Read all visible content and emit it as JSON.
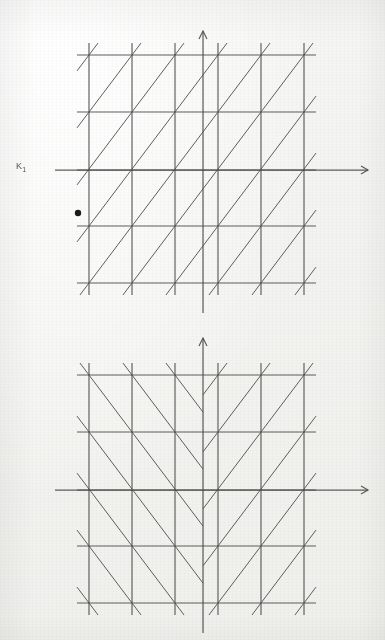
{
  "page": {
    "background_color": "#f4f4f2",
    "line_color": "#4d4d4d",
    "dot_color": "#1a1a1a",
    "top_faint_text": ""
  },
  "figures": [
    {
      "id": "fig1",
      "label": "K",
      "label_sub": "1",
      "label_prime": "",
      "caption": "",
      "lattice": {
        "type": "square-lattice-with-one-diagonal-family",
        "grid_x": [
          89,
          132,
          175,
          218,
          261,
          304
        ],
        "grid_y": [
          55,
          112,
          170,
          226,
          283
        ],
        "cell_width": 43,
        "cell_height": 57,
        "diagonal_directions": [
          "/"
        ],
        "mirror_symmetric": false,
        "axis_x_y": 170,
        "axis_y_x": 203,
        "axis_x_end": 368,
        "axis_y_top": 31,
        "marked_point": {
          "x": 78,
          "y": 213,
          "radius": 3.2
        }
      }
    },
    {
      "id": "fig2",
      "label": "K",
      "label_sub": "1",
      "label_prime": "′",
      "caption": "",
      "lattice": {
        "type": "square-lattice-with-mirrored-diagonals",
        "grid_x": [
          89,
          132,
          175,
          218,
          261,
          304
        ],
        "grid_y": [
          55,
          112,
          170,
          226,
          283
        ],
        "cell_width": 43,
        "cell_height": 57,
        "diagonal_directions": [
          "\\",
          "/"
        ],
        "mirror_symmetric": true,
        "mirror_axis_x": 203,
        "axis_x_y": 170,
        "axis_y_x": 203,
        "axis_x_end": 368,
        "axis_y_top": 18,
        "marked_point": null
      }
    }
  ]
}
